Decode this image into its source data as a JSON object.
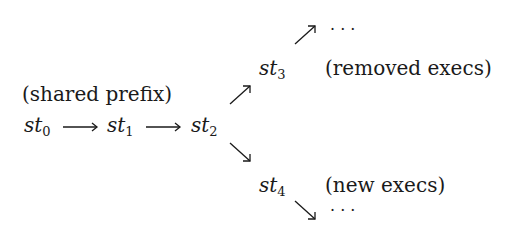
{
  "diagram": {
    "prefix_label": "(shared prefix)",
    "nodes": [
      {
        "id": "st0",
        "base": "st",
        "sub": "0"
      },
      {
        "id": "st1",
        "base": "st",
        "sub": "1"
      },
      {
        "id": "st2",
        "base": "st",
        "sub": "2"
      },
      {
        "id": "st3",
        "base": "st",
        "sub": "3"
      },
      {
        "id": "st4",
        "base": "st",
        "sub": "4"
      }
    ],
    "edges": [
      {
        "from": "st0",
        "to": "st1",
        "glyph": "⟶"
      },
      {
        "from": "st1",
        "to": "st2",
        "glyph": "⟶"
      },
      {
        "from": "st2",
        "to": "st3",
        "glyph": "↗"
      },
      {
        "from": "st2",
        "to": "st4",
        "glyph": "↘"
      },
      {
        "from": "st3",
        "to": "ellipsis-top",
        "glyph": "↗"
      },
      {
        "from": "st4",
        "to": "ellipsis-bottom",
        "glyph": "↘"
      }
    ],
    "st3_label": "(removed execs)",
    "st4_label": "(new execs)",
    "ellipsis": "· · ·"
  }
}
